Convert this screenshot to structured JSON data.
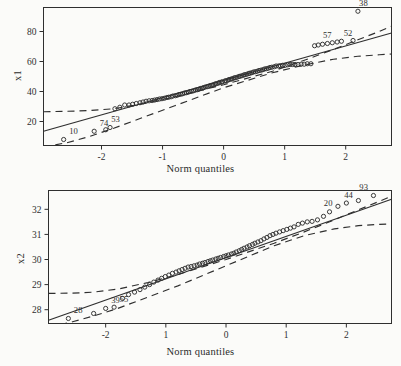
{
  "figure": {
    "background_color": "#fbfbf9",
    "ink_color": "#2f2f2f",
    "panel_count": 2
  },
  "chart_data": [
    {
      "type": "scatter",
      "title": "",
      "subtitle": "",
      "xlabel": "Norm quantiles",
      "ylabel": "x1",
      "xlim": [
        -2.95,
        2.75
      ],
      "ylim": [
        4,
        96
      ],
      "xticks": [
        -2,
        -1,
        0,
        1,
        2
      ],
      "xticklabels": [
        "-2",
        "-1",
        "0",
        "1",
        "2"
      ],
      "yticks": [
        20,
        40,
        60,
        80
      ],
      "yticklabels": [
        "20",
        "40",
        "60",
        "80"
      ],
      "grid": false,
      "legend": null,
      "frame": true,
      "series": [
        {
          "name": "sample quantiles",
          "marker": "open-circle",
          "x": [
            -2.62,
            -2.12,
            -1.93,
            -1.86,
            -1.78,
            -1.7,
            -1.62,
            -1.55,
            -1.49,
            -1.43,
            -1.37,
            -1.32,
            -1.27,
            -1.22,
            -1.17,
            -1.13,
            -1.09,
            -1.05,
            -1.01,
            -0.97,
            -0.93,
            -0.9,
            -0.86,
            -0.83,
            -0.79,
            -0.76,
            -0.73,
            -0.7,
            -0.67,
            -0.64,
            -0.61,
            -0.58,
            -0.55,
            -0.52,
            -0.49,
            -0.46,
            -0.43,
            -0.41,
            -0.38,
            -0.35,
            -0.33,
            -0.3,
            -0.27,
            -0.25,
            -0.22,
            -0.19,
            -0.17,
            -0.14,
            -0.12,
            -0.09,
            -0.07,
            -0.04,
            -0.02,
            0.02,
            0.04,
            0.07,
            0.09,
            0.12,
            0.14,
            0.17,
            0.19,
            0.22,
            0.25,
            0.27,
            0.3,
            0.33,
            0.35,
            0.38,
            0.41,
            0.43,
            0.46,
            0.49,
            0.52,
            0.55,
            0.58,
            0.61,
            0.64,
            0.67,
            0.7,
            0.73,
            0.76,
            0.79,
            0.83,
            0.86,
            0.9,
            0.93,
            0.97,
            1.01,
            1.05,
            1.09,
            1.13,
            1.17,
            1.22,
            1.27,
            1.32,
            1.37,
            1.43,
            1.49,
            1.55,
            1.62,
            1.7,
            1.78,
            1.86,
            1.93,
            2.12,
            2.2,
            2.45
          ],
          "y": [
            8.0,
            13.5,
            14.5,
            16.0,
            28.5,
            29.5,
            31.0,
            31.0,
            31.5,
            32.0,
            32.5,
            33.0,
            33.5,
            33.8,
            34.0,
            34.3,
            34.6,
            35.0,
            35.2,
            35.5,
            36.0,
            36.2,
            36.5,
            37.0,
            37.2,
            37.5,
            38.0,
            38.2,
            38.5,
            39.0,
            39.2,
            39.5,
            40.0,
            40.2,
            40.5,
            41.0,
            41.2,
            41.5,
            42.0,
            42.2,
            42.5,
            43.0,
            43.2,
            43.5,
            44.0,
            44.2,
            44.5,
            45.0,
            45.2,
            45.5,
            46.0,
            46.2,
            46.5,
            47.0,
            47.2,
            47.5,
            48.0,
            48.2,
            48.5,
            49.0,
            49.2,
            49.5,
            50.0,
            50.2,
            50.5,
            51.0,
            51.2,
            51.5,
            52.0,
            52.2,
            52.5,
            53.0,
            53.2,
            53.5,
            54.0,
            54.2,
            54.5,
            55.0,
            55.2,
            55.5,
            56.0,
            56.2,
            56.5,
            57.0,
            57.0,
            57.2,
            57.5,
            57.5,
            57.8,
            58.0,
            58.0,
            58.0,
            58.0,
            58.2,
            58.2,
            58.5,
            58.5,
            70.5,
            71.0,
            71.5,
            72.0,
            72.5,
            73.0,
            73.5,
            74.0,
            93.5
          ]
        }
      ],
      "fit_line": {
        "type": "solid",
        "x": [
          -2.95,
          2.75
        ],
        "y": [
          13.5,
          79.0
        ]
      },
      "confidence_bands": [
        {
          "type": "dashed",
          "name": "upper",
          "x": [
            -2.95,
            -2.55,
            -2.2,
            -1.8,
            -1.3,
            -0.8,
            0,
            0.8,
            1.3,
            1.8,
            2.2,
            2.55,
            2.75
          ],
          "y": [
            26.5,
            26.8,
            27.3,
            28.5,
            32.0,
            36.5,
            44.5,
            53.5,
            60.5,
            68.0,
            74.5,
            80.0,
            83.5
          ]
        },
        {
          "type": "dashed",
          "name": "lower",
          "x": [
            -2.95,
            -2.55,
            -2.2,
            -1.8,
            -1.3,
            -0.8,
            0,
            0.8,
            1.3,
            1.8,
            2.2,
            2.55,
            2.75
          ],
          "y": [
            3.0,
            6.0,
            10.0,
            15.5,
            23.0,
            30.5,
            42.5,
            52.5,
            57.5,
            61.5,
            63.5,
            64.5,
            65.0
          ]
        }
      ],
      "point_labels": [
        {
          "text": "10",
          "x": -2.62,
          "y": 8.0
        },
        {
          "text": "74",
          "x": -2.12,
          "y": 13.5
        },
        {
          "text": "53",
          "x": -1.93,
          "y": 16.0
        },
        {
          "text": "57",
          "x": 1.86,
          "y": 72.0
        },
        {
          "text": "52",
          "x": 2.2,
          "y": 73.5
        },
        {
          "text": "38",
          "x": 2.45,
          "y": 93.5
        }
      ]
    },
    {
      "type": "scatter",
      "title": "",
      "subtitle": "",
      "xlabel": "Norm quantiles",
      "ylabel": "x2",
      "xlim": [
        -2.95,
        2.75
      ],
      "ylim": [
        27.45,
        32.75
      ],
      "xticks": [
        -2,
        -1,
        0,
        1,
        2
      ],
      "xticklabels": [
        "-2",
        "1",
        "0",
        "1",
        "2"
      ],
      "yticks": [
        28,
        29,
        30,
        31,
        32
      ],
      "yticklabels": [
        "28",
        "29",
        "30",
        "31",
        "32"
      ],
      "grid": false,
      "legend": null,
      "frame": true,
      "series": [
        {
          "name": "sample quantiles",
          "marker": "open-circle",
          "x": [
            -2.62,
            -2.2,
            -2.0,
            -1.86,
            -1.72,
            -1.62,
            -1.52,
            -1.43,
            -1.35,
            -1.27,
            -1.2,
            -1.13,
            -1.07,
            -1.01,
            -0.95,
            -0.89,
            -0.83,
            -0.78,
            -0.73,
            -0.68,
            -0.63,
            -0.58,
            -0.53,
            -0.48,
            -0.44,
            -0.39,
            -0.35,
            -0.3,
            -0.26,
            -0.22,
            -0.17,
            -0.13,
            -0.09,
            -0.04,
            0.0,
            0.04,
            0.09,
            0.13,
            0.17,
            0.22,
            0.26,
            0.3,
            0.35,
            0.39,
            0.44,
            0.48,
            0.53,
            0.58,
            0.63,
            0.68,
            0.73,
            0.78,
            0.83,
            0.89,
            0.95,
            1.01,
            1.07,
            1.13,
            1.2,
            1.27,
            1.35,
            1.43,
            1.52,
            1.62,
            1.72,
            1.86,
            2.0,
            2.2,
            2.45
          ],
          "y": [
            27.65,
            27.85,
            28.05,
            28.1,
            28.45,
            28.6,
            28.7,
            28.8,
            28.9,
            29.0,
            29.1,
            29.18,
            29.25,
            29.32,
            29.38,
            29.45,
            29.5,
            29.55,
            29.6,
            29.65,
            29.7,
            29.72,
            29.75,
            29.78,
            29.82,
            29.85,
            29.88,
            29.92,
            29.95,
            29.98,
            30.02,
            30.05,
            30.08,
            30.12,
            30.15,
            30.18,
            30.22,
            30.25,
            30.3,
            30.35,
            30.4,
            30.45,
            30.5,
            30.55,
            30.6,
            30.65,
            30.7,
            30.75,
            30.82,
            30.88,
            30.95,
            31.0,
            31.05,
            31.1,
            31.15,
            31.2,
            31.25,
            31.3,
            31.4,
            31.45,
            31.5,
            31.52,
            31.58,
            31.72,
            31.9,
            32.12,
            32.25,
            32.35,
            32.55
          ]
        }
      ],
      "fit_line": {
        "type": "solid",
        "x": [
          -2.95,
          2.75
        ],
        "y": [
          27.58,
          32.4
        ]
      },
      "confidence_bands": [
        {
          "type": "dashed",
          "name": "upper",
          "x": [
            -2.95,
            -2.55,
            -2.2,
            -1.8,
            -1.3,
            -0.8,
            0,
            0.8,
            1.3,
            1.8,
            2.2,
            2.55,
            2.75
          ],
          "y": [
            28.65,
            28.66,
            28.7,
            28.82,
            29.08,
            29.4,
            30.0,
            30.65,
            31.1,
            31.58,
            31.98,
            32.32,
            32.52
          ]
        },
        {
          "type": "dashed",
          "name": "lower",
          "x": [
            -2.95,
            -2.55,
            -2.2,
            -1.8,
            -1.3,
            -0.8,
            0,
            0.8,
            1.3,
            1.8,
            2.2,
            2.55,
            2.75
          ],
          "y": [
            27.3,
            27.52,
            27.75,
            28.05,
            28.5,
            28.95,
            29.75,
            30.55,
            30.95,
            31.22,
            31.35,
            31.4,
            31.42
          ]
        }
      ],
      "point_labels": [
        {
          "text": "28",
          "x": -2.62,
          "y": 27.65
        },
        {
          "text": "39",
          "x": -2.0,
          "y": 28.05
        },
        {
          "text": "55",
          "x": -1.86,
          "y": 28.1
        },
        {
          "text": "20",
          "x": 1.86,
          "y": 31.9
        },
        {
          "text": "44",
          "x": 2.2,
          "y": 32.25
        },
        {
          "text": "93",
          "x": 2.45,
          "y": 32.55
        }
      ]
    }
  ]
}
